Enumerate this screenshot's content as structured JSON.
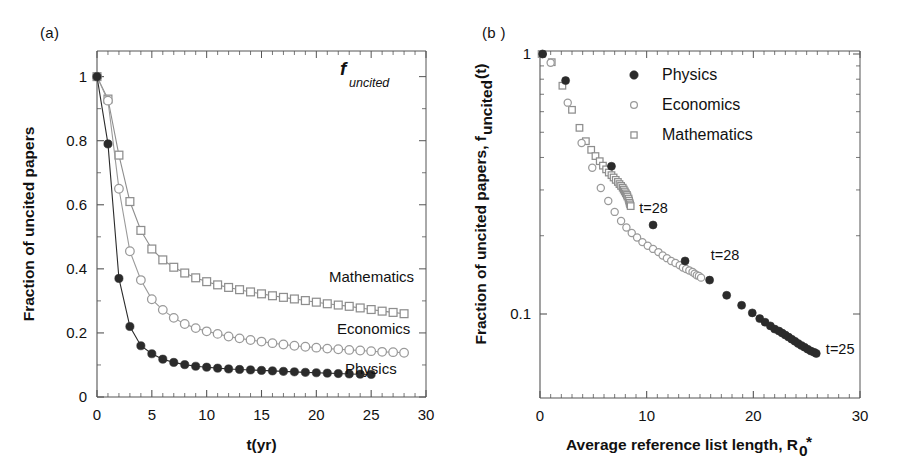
{
  "figure": {
    "width": 912,
    "height": 474,
    "background": "#ffffff",
    "panels": [
      {
        "id": "a",
        "label": "(a)"
      },
      {
        "id": "b",
        "label": "(b )"
      }
    ]
  },
  "colors": {
    "physics": "#2b2b2b",
    "economics": "#9a9a9a",
    "mathematics": "#8e8e8e",
    "axis": "#555555",
    "text": "#111111",
    "background": "#ffffff"
  },
  "panel_a": {
    "label": "(a)",
    "inline_annotation": {
      "symbol": "f",
      "subscript": "uncited"
    },
    "xlabel": "t(yr)",
    "ylabel": "Fraction of uncited papers",
    "xticklabels": [
      "0",
      "5",
      "10",
      "15",
      "20",
      "25",
      "30"
    ],
    "yticklabels": [
      "0",
      "0.2",
      "0.4",
      "0.6",
      "0.8",
      "1"
    ],
    "series_labels": [
      "Mathematics",
      "Economics",
      "Physics"
    ]
  },
  "panel_b": {
    "label": "(b )",
    "xlabel_main": "Average reference list length, R",
    "xlabel_sub": "0",
    "xlabel_star": "*",
    "ylabel_main": "Fraction of uncited papers, f",
    "ylabel_sub": "uncited",
    "ylabel_tail": "(t)",
    "xticklabels": [
      "0",
      "10",
      "20",
      "30"
    ],
    "yticklabels": [
      "1",
      "0.1"
    ],
    "legend": [
      {
        "label": "Physics",
        "marker": "filled-circle"
      },
      {
        "label": "Economics",
        "marker": "open-circle"
      },
      {
        "label": "Mathematics",
        "marker": "open-square"
      }
    ],
    "annotations": [
      {
        "text": "t=28",
        "series": "Mathematics"
      },
      {
        "text": "t=28",
        "series": "Economics"
      },
      {
        "text": "t=25",
        "series": "Physics"
      }
    ]
  },
  "chart_data": [
    {
      "panel": "a",
      "type": "line",
      "title": "",
      "annotation": "f_uncited",
      "xlabel": "t(yr)",
      "ylabel": "Fraction of uncited papers",
      "xlim": [
        0,
        30
      ],
      "ylim": [
        0,
        1.08
      ],
      "xticks": [
        0,
        5,
        10,
        15,
        20,
        25,
        30
      ],
      "yticks": [
        0,
        0.2,
        0.4,
        0.6,
        0.8,
        1
      ],
      "grid": false,
      "legend": "inline-right",
      "series": [
        {
          "name": "Physics",
          "marker": "filled-circle",
          "color": "#2b2b2b",
          "x": [
            0,
            1,
            2,
            3,
            4,
            5,
            6,
            7,
            8,
            9,
            10,
            11,
            12,
            13,
            14,
            15,
            16,
            17,
            18,
            19,
            20,
            21,
            22,
            23,
            24,
            25
          ],
          "y": [
            1.0,
            0.79,
            0.37,
            0.22,
            0.16,
            0.135,
            0.118,
            0.108,
            0.101,
            0.096,
            0.093,
            0.09,
            0.0875,
            0.086,
            0.0845,
            0.083,
            0.0815,
            0.08,
            0.0785,
            0.077,
            0.0757,
            0.0745,
            0.0732,
            0.072,
            0.0712,
            0.0705
          ]
        },
        {
          "name": "Economics",
          "marker": "open-circle",
          "color": "#9a9a9a",
          "x": [
            0,
            1,
            2,
            3,
            4,
            5,
            6,
            7,
            8,
            9,
            10,
            11,
            12,
            13,
            14,
            15,
            16,
            17,
            18,
            19,
            20,
            21,
            22,
            23,
            24,
            25,
            26,
            27,
            28
          ],
          "y": [
            1.0,
            0.925,
            0.65,
            0.455,
            0.365,
            0.305,
            0.272,
            0.247,
            0.228,
            0.215,
            0.205,
            0.197,
            0.189,
            0.183,
            0.178,
            0.173,
            0.168,
            0.164,
            0.16,
            0.157,
            0.154,
            0.151,
            0.149,
            0.147,
            0.145,
            0.143,
            0.141,
            0.14,
            0.138
          ]
        },
        {
          "name": "Mathematics",
          "marker": "open-square",
          "color": "#8e8e8e",
          "x": [
            0,
            1,
            2,
            3,
            4,
            5,
            6,
            7,
            8,
            9,
            10,
            11,
            12,
            13,
            14,
            15,
            16,
            17,
            18,
            19,
            20,
            21,
            22,
            23,
            24,
            25,
            26,
            27,
            28
          ],
          "y": [
            1.0,
            0.93,
            0.755,
            0.61,
            0.52,
            0.462,
            0.428,
            0.405,
            0.387,
            0.372,
            0.36,
            0.35,
            0.342,
            0.335,
            0.328,
            0.322,
            0.316,
            0.311,
            0.306,
            0.301,
            0.296,
            0.291,
            0.287,
            0.283,
            0.278,
            0.273,
            0.268,
            0.264,
            0.26
          ]
        }
      ]
    },
    {
      "panel": "b",
      "type": "scatter",
      "title": "",
      "xlabel": "Average reference list length, R0*",
      "ylabel": "Fraction of uncited papers, f_uncited(t)",
      "xlim": [
        0,
        30
      ],
      "ylim": [
        0.055,
        1.12
      ],
      "yscale": "log",
      "xticks": [
        0,
        10,
        20,
        30
      ],
      "yticks": [
        1,
        0.1
      ],
      "grid": false,
      "legend": "top-right",
      "series": [
        {
          "name": "Physics",
          "marker": "filled-circle",
          "color": "#2b2b2b",
          "x": [
            0.25,
            2.4,
            6.7,
            10.6,
            13.6,
            15.9,
            17.5,
            18.9,
            19.9,
            20.6,
            21.1,
            21.6,
            22.0,
            22.4,
            22.7,
            23.0,
            23.3,
            23.6,
            23.9,
            24.2,
            24.5,
            24.8,
            25.1,
            25.4,
            25.7,
            25.9
          ],
          "y": [
            1.0,
            0.79,
            0.37,
            0.22,
            0.16,
            0.135,
            0.118,
            0.108,
            0.101,
            0.096,
            0.093,
            0.09,
            0.0875,
            0.086,
            0.0845,
            0.083,
            0.0815,
            0.08,
            0.0785,
            0.077,
            0.0757,
            0.0745,
            0.0732,
            0.072,
            0.0712,
            0.0705
          ]
        },
        {
          "name": "Economics",
          "marker": "open-circle",
          "color": "#9a9a9a",
          "x": [
            0.2,
            1.0,
            2.6,
            3.9,
            4.9,
            5.7,
            6.4,
            7.0,
            7.6,
            8.1,
            8.6,
            9.1,
            9.6,
            10.1,
            10.6,
            11.1,
            11.5,
            11.9,
            12.3,
            12.7,
            13.1,
            13.4,
            13.7,
            14.0,
            14.3,
            14.5,
            14.7,
            14.9,
            15.1
          ],
          "y": [
            1.0,
            0.925,
            0.65,
            0.455,
            0.365,
            0.305,
            0.272,
            0.247,
            0.228,
            0.215,
            0.205,
            0.197,
            0.189,
            0.183,
            0.178,
            0.173,
            0.168,
            0.164,
            0.16,
            0.157,
            0.154,
            0.151,
            0.149,
            0.147,
            0.145,
            0.143,
            0.141,
            0.14,
            0.138
          ]
        },
        {
          "name": "Mathematics",
          "marker": "open-square",
          "color": "#8e8e8e",
          "x": [
            0.15,
            1.1,
            2.1,
            3.0,
            3.7,
            4.3,
            4.8,
            5.2,
            5.6,
            5.9,
            6.2,
            6.45,
            6.7,
            6.9,
            7.1,
            7.3,
            7.45,
            7.6,
            7.75,
            7.85,
            7.95,
            8.05,
            8.15,
            8.2,
            8.3,
            8.35,
            8.4,
            8.45,
            8.5
          ],
          "y": [
            1.0,
            0.93,
            0.755,
            0.61,
            0.52,
            0.462,
            0.428,
            0.405,
            0.387,
            0.372,
            0.36,
            0.35,
            0.342,
            0.335,
            0.328,
            0.322,
            0.316,
            0.311,
            0.306,
            0.301,
            0.296,
            0.291,
            0.287,
            0.283,
            0.278,
            0.273,
            0.268,
            0.264,
            0.26
          ]
        }
      ],
      "annotations": [
        {
          "text": "t=28",
          "x": 9.3,
          "y": 0.255,
          "series": "Mathematics"
        },
        {
          "text": "t=28",
          "x": 16.0,
          "y": 0.168,
          "series": "Economics"
        },
        {
          "text": "t=25",
          "x": 26.8,
          "y": 0.0735,
          "series": "Physics"
        }
      ]
    }
  ]
}
